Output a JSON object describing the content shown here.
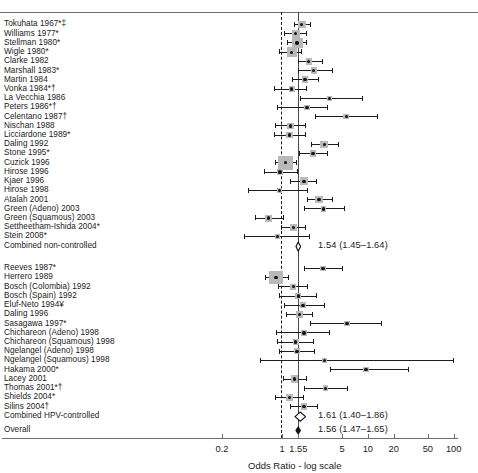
{
  "chart_data": {
    "type": "forest",
    "title": "",
    "xlabel": "Odds Ratio - log scale",
    "xscale": "log",
    "xticks": [
      0.2,
      1,
      1.55,
      5,
      10,
      20,
      50,
      100
    ],
    "xtick_labels": [
      "0.2",
      "1",
      "1.55",
      "5",
      "10",
      "20",
      "50",
      "100"
    ],
    "xlim": [
      0.15,
      140
    ],
    "reference_lines": [
      {
        "value": 1,
        "style": "dashed"
      },
      {
        "value": 1.55,
        "style": "solid"
      }
    ],
    "groups": [
      {
        "name": "non-controlled",
        "rows": [
          {
            "label": "Tokuhata 1967*‡",
            "or": 1.7,
            "lo": 1.38,
            "hi": 2.2,
            "weight": 0.55
          },
          {
            "label": "Williams 1977*",
            "or": 1.45,
            "lo": 1.05,
            "hi": 1.95,
            "weight": 0.6
          },
          {
            "label": "Stellman 1980*",
            "or": 1.5,
            "lo": 1.15,
            "hi": 1.98,
            "weight": 0.95
          },
          {
            "label": "Wigle 1980*",
            "or": 1.3,
            "lo": 0.92,
            "hi": 1.72,
            "weight": 0.85
          },
          {
            "label": "Clarke 1982",
            "or": 2.05,
            "lo": 1.52,
            "hi": 3.0,
            "weight": 0.4
          },
          {
            "label": "Marshall 1983*",
            "or": 2.35,
            "lo": 1.55,
            "hi": 3.9,
            "weight": 0.4
          },
          {
            "label": "Martin 1984",
            "or": 1.85,
            "lo": 1.3,
            "hi": 2.7,
            "weight": 0.45
          },
          {
            "label": "Vonka 1984*†",
            "or": 1.3,
            "lo": 0.8,
            "hi": 1.95,
            "weight": 0.4
          },
          {
            "label": "La Vecchia 1986",
            "or": 3.6,
            "lo": 1.6,
            "hi": 8.7,
            "weight": 0.25
          },
          {
            "label": "Peters 1986*†",
            "or": 1.95,
            "lo": 0.88,
            "hi": 3.4,
            "weight": 0.3
          },
          {
            "label": "Celentano 1987†",
            "or": 5.6,
            "lo": 2.4,
            "hi": 13.0,
            "weight": 0.3
          },
          {
            "label": "Nischan 1988",
            "or": 1.25,
            "lo": 0.82,
            "hi": 1.9,
            "weight": 0.4
          },
          {
            "label": "Licciardone 1989*",
            "or": 1.22,
            "lo": 0.8,
            "hi": 1.88,
            "weight": 0.4
          },
          {
            "label": "Daling 1992",
            "or": 3.1,
            "lo": 2.15,
            "hi": 4.6,
            "weight": 0.55
          },
          {
            "label": "Stone 1995*",
            "or": 2.3,
            "lo": 1.58,
            "hi": 3.45,
            "weight": 0.45
          },
          {
            "label": "Cuzick 1996",
            "or": 1.1,
            "lo": 0.83,
            "hi": 1.48,
            "weight": 1.4
          },
          {
            "label": "Hirose 1996",
            "or": 0.95,
            "lo": 0.62,
            "hi": 1.55,
            "weight": 0.25
          },
          {
            "label": "Kjaer 1996",
            "or": 1.8,
            "lo": 1.25,
            "hi": 2.55,
            "weight": 0.55
          },
          {
            "label": "Hirose 1998",
            "or": 0.93,
            "lo": 0.4,
            "hi": 2.0,
            "weight": 0.22
          },
          {
            "label": "Atalah 2001",
            "or": 2.7,
            "lo": 1.95,
            "hi": 3.9,
            "weight": 0.55
          },
          {
            "label": "Green (Adeno) 2003",
            "or": 3.05,
            "lo": 1.82,
            "hi": 5.4,
            "weight": 0.28
          },
          {
            "label": "Green (Squamous) 2003",
            "or": 0.7,
            "lo": 0.49,
            "hi": 1.05,
            "weight": 0.45
          },
          {
            "label": "Settheetham-Ishida 2004*",
            "or": 1.35,
            "lo": 0.98,
            "hi": 1.88,
            "weight": 0.5
          },
          {
            "label": "Stein 2008*",
            "or": 0.88,
            "lo": 0.36,
            "hi": 2.1,
            "weight": 0.25
          }
        ],
        "summary": {
          "label": "Combined non-controlled",
          "or": 1.54,
          "lo": 1.45,
          "hi": 1.64,
          "text": "1.54 (1.45–1.64)"
        }
      },
      {
        "name": "HPV-controlled",
        "rows": [
          {
            "label": "Reeves 1987*",
            "or": 3.0,
            "lo": 1.8,
            "hi": 5.2,
            "weight": 0.3
          },
          {
            "label": "Herrero 1989",
            "or": 0.85,
            "lo": 0.63,
            "hi": 1.22,
            "weight": 1.25
          },
          {
            "label": "Bosch (Colombia) 1992",
            "or": 1.35,
            "lo": 0.9,
            "hi": 2.0,
            "weight": 0.35
          },
          {
            "label": "Bosch (Spain) 1992",
            "or": 1.55,
            "lo": 0.93,
            "hi": 2.55,
            "weight": 0.35
          },
          {
            "label": "Eluf-Neto 1994¥",
            "or": 1.75,
            "lo": 1.05,
            "hi": 3.15,
            "weight": 0.35
          },
          {
            "label": "Daling 1996",
            "or": 1.6,
            "lo": 1.12,
            "hi": 2.3,
            "weight": 0.45
          },
          {
            "label": "Sasagawa 1997*",
            "or": 5.7,
            "lo": 2.1,
            "hi": 14.5,
            "weight": 0.26
          },
          {
            "label": "Chichareon (Adeno) 1998",
            "or": 1.8,
            "lo": 0.86,
            "hi": 3.6,
            "weight": 0.3
          },
          {
            "label": "Chichareon (Squamous) 1998",
            "or": 1.45,
            "lo": 0.88,
            "hi": 2.35,
            "weight": 0.32
          },
          {
            "label": "Ngelangel (Adeno) 1998",
            "or": 1.5,
            "lo": 0.93,
            "hi": 2.4,
            "weight": 0.32
          },
          {
            "label": "Ngelangel (Squamous) 1998",
            "or": 3.1,
            "lo": 0.55,
            "hi": 100.0,
            "weight": 0.22
          },
          {
            "label": "Hakama 2000*",
            "or": 9.5,
            "lo": 3.6,
            "hi": 30.0,
            "weight": 0.26
          },
          {
            "label": "Lacey 2001",
            "or": 1.4,
            "lo": 1.02,
            "hi": 1.98,
            "weight": 0.5
          },
          {
            "label": "Thomas 2001*†",
            "or": 3.2,
            "lo": 1.82,
            "hi": 5.9,
            "weight": 0.3
          },
          {
            "label": "Shields 2004*",
            "or": 1.22,
            "lo": 0.82,
            "hi": 1.8,
            "weight": 0.4
          },
          {
            "label": "Silins 2004†",
            "or": 1.8,
            "lo": 1.25,
            "hi": 2.6,
            "weight": 0.45
          }
        ],
        "summary": {
          "label": "Combined HPV-controlled",
          "or": 1.61,
          "lo": 1.4,
          "hi": 1.86,
          "text": "1.61 (1.40–1.86)"
        }
      }
    ],
    "overall": {
      "label": "Overall",
      "or": 1.56,
      "lo": 1.47,
      "hi": 1.65,
      "text": "1.56 (1.47–1.65)"
    }
  },
  "colors": {
    "marker": "#141414",
    "box": "#b9b9b9",
    "axis": "#6e6e6e",
    "reference_solid": "#4a4a4a",
    "reference_dashed": "#1c1c1c"
  }
}
